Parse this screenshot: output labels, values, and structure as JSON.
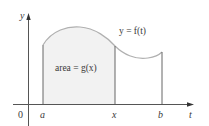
{
  "diagram": {
    "type": "area-under-curve",
    "curve_label": "y = f(t)",
    "area_label": "area = g(x)",
    "axes": {
      "vertical": "y",
      "horizontal": "t",
      "origin": "0"
    },
    "tick_labels": {
      "a": "a",
      "x": "x",
      "b": "b"
    },
    "colors": {
      "axis": "#555555",
      "curve": "#b0b0b0",
      "shade": "#f2f2f2",
      "text": "#3a3a3a"
    }
  }
}
